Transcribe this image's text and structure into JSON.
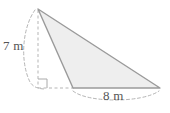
{
  "figure": {
    "type": "geometry-diagram",
    "shape": "triangle",
    "background_color": "#ffffff",
    "fill_color": "#eeeeee",
    "stroke_color": "#9a9a9a",
    "guide_color": "#b5b5b5",
    "label_color": "#555555",
    "labels": {
      "height": "7 m",
      "base": "8 m"
    },
    "measurements": [
      {
        "name": "height",
        "value": 7,
        "unit": "m",
        "text": "7 m"
      },
      {
        "name": "base",
        "value": 8,
        "unit": "m",
        "text": "8 m"
      }
    ],
    "markers": {
      "right_angle": "right-angle-square"
    },
    "vertices": {
      "apex": [
        38,
        9
      ],
      "base_left": [
        73,
        88
      ],
      "base_right": [
        160,
        88
      ]
    },
    "altitude_foot": [
      38,
      88
    ]
  }
}
